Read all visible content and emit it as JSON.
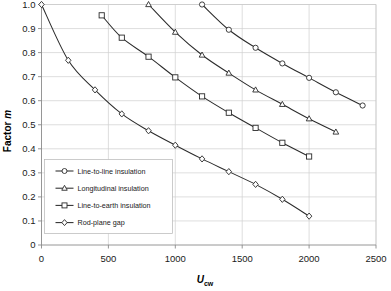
{
  "chart_data": {
    "type": "line",
    "title": "",
    "xlabel": "Ucw",
    "xlabel_main": "U",
    "xlabel_sub": "cw",
    "ylabel": "Factor m",
    "ylabel_main": "Factor",
    "ylabel_italic": "m",
    "xlim": [
      0,
      2500
    ],
    "ylim": [
      0,
      1.0
    ],
    "xticks": [
      0,
      500,
      1000,
      1500,
      2000,
      2500
    ],
    "xtick_labels": [
      "0",
      "500",
      "1000",
      "1500",
      "2000",
      "2500"
    ],
    "yticks": [
      0,
      0.1,
      0.2,
      0.3,
      0.4,
      0.5,
      0.6,
      0.7,
      0.8,
      0.9,
      1.0
    ],
    "ytick_labels": [
      "0",
      "0.1",
      "0.2",
      "0.3",
      "0.4",
      "0.5",
      "0.6",
      "0.7",
      "0.8",
      "0.9",
      "1.0"
    ],
    "grid": true,
    "legend_position": "lower-left-inside",
    "series": [
      {
        "name": "Line-to-line insulation",
        "marker": "circle",
        "color": "#2b2b2b",
        "x": [
          1200,
          1400,
          1600,
          1800,
          2000,
          2200,
          2400
        ],
        "y": [
          1.0,
          0.895,
          0.82,
          0.755,
          0.695,
          0.635,
          0.58
        ]
      },
      {
        "name": "Longitudinal insulation",
        "marker": "triangle",
        "color": "#2b2b2b",
        "x": [
          800,
          1000,
          1200,
          1400,
          1600,
          1800,
          2000,
          2200
        ],
        "y": [
          1.0,
          0.885,
          0.79,
          0.715,
          0.645,
          0.585,
          0.525,
          0.47
        ]
      },
      {
        "name": "Line-to-earth insulation",
        "marker": "square",
        "color": "#2b2b2b",
        "x": [
          450,
          600,
          800,
          1000,
          1200,
          1400,
          1600,
          1800,
          2000
        ],
        "y": [
          0.955,
          0.862,
          0.783,
          0.697,
          0.618,
          0.55,
          0.487,
          0.425,
          0.368
        ]
      },
      {
        "name": "Rod-plane gap",
        "marker": "diamond",
        "color": "#2b2b2b",
        "x": [
          0,
          200,
          400,
          600,
          800,
          1000,
          1200,
          1400,
          1600,
          1800,
          2000
        ],
        "y": [
          1.0,
          0.768,
          0.645,
          0.545,
          0.475,
          0.415,
          0.358,
          0.305,
          0.252,
          0.19,
          0.12
        ]
      }
    ],
    "legend_entries": [
      "Line-to-line insulation",
      "Longitudinal insulation",
      "Line-to-earth insulation",
      "Rod-plane gap"
    ]
  }
}
